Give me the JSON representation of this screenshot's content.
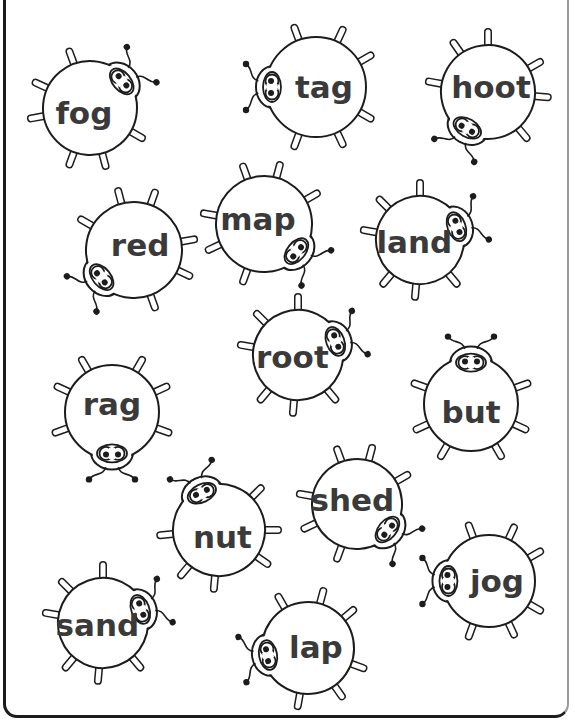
{
  "worksheet": {
    "description": "Bug word worksheet with CVC / phonics words written on round bug bodies",
    "colors": {
      "outline": "#1c1c1c",
      "text": "#3a3a3a",
      "background": "#ffffff"
    },
    "bugs": [
      {
        "word": "fog",
        "cx": 90,
        "cy": 108,
        "r": 47,
        "head_angle": -40
      },
      {
        "word": "tag",
        "cx": 316,
        "cy": 87,
        "r": 50,
        "head_angle": 180
      },
      {
        "word": "hoot",
        "cx": 488,
        "cy": 92,
        "r": 47,
        "head_angle": 120
      },
      {
        "word": "red",
        "cx": 134,
        "cy": 250,
        "r": 48,
        "head_angle": 140
      },
      {
        "word": "map",
        "cx": 264,
        "cy": 224,
        "r": 48,
        "head_angle": 40
      },
      {
        "word": "land",
        "cx": 420,
        "cy": 240,
        "r": 44,
        "head_angle": -20
      },
      {
        "word": "root",
        "cx": 298,
        "cy": 355,
        "r": 45,
        "head_angle": -20
      },
      {
        "word": "but",
        "cx": 471,
        "cy": 404,
        "r": 47,
        "head_angle": -90
      },
      {
        "word": "rag",
        "cx": 112,
        "cy": 412,
        "r": 47,
        "head_angle": 90
      },
      {
        "word": "nut",
        "cx": 219,
        "cy": 530,
        "r": 46,
        "head_angle": -115
      },
      {
        "word": "shed",
        "cx": 357,
        "cy": 504,
        "r": 45,
        "head_angle": 40
      },
      {
        "word": "jog",
        "cx": 489,
        "cy": 581,
        "r": 46,
        "head_angle": 180
      },
      {
        "word": "sand",
        "cx": 103,
        "cy": 623,
        "r": 45,
        "head_angle": -20
      },
      {
        "word": "lap",
        "cx": 308,
        "cy": 648,
        "r": 46,
        "head_angle": 170
      }
    ]
  }
}
